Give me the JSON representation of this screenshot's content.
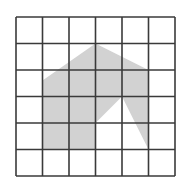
{
  "figure": {
    "type": "grid-with-shaded-polygon",
    "grid": {
      "rows": 6,
      "cols": 6,
      "origin_px": [
        16,
        17
      ],
      "cell_px": 26.5,
      "line_color": "#3a3a3a",
      "line_width": 1.6,
      "background": "#ffffff"
    },
    "shape": {
      "fill": "#d2d2d2",
      "vertices_grid": [
        [
          1,
          5
        ],
        [
          1,
          2.4
        ],
        [
          3,
          1
        ],
        [
          5,
          2
        ],
        [
          5,
          5
        ],
        [
          4,
          3
        ],
        [
          3,
          4
        ],
        [
          3,
          5
        ]
      ]
    }
  }
}
